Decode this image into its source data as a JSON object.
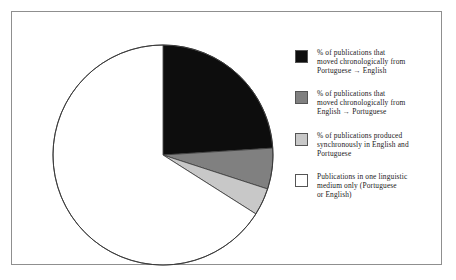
{
  "chart_data": {
    "type": "pie",
    "title": "",
    "subtitle": "",
    "xlabel": "",
    "ylabel": "",
    "grid": false,
    "legend_position": "right",
    "start_angle_deg": 0,
    "direction": "clockwise",
    "categories": [
      "% of publications that moved chronologically from Portuguese → English",
      "% of publications that moved chronologically from English → Portuguese",
      "% of publications produced synchronously in English and Portuguese",
      "Publications in one linguistic medium only (Portuguese or English)"
    ],
    "values": [
      24,
      6,
      4,
      66
    ],
    "colors": [
      "#0d0d0d",
      "#808080",
      "#c8c8c8",
      "#ffffff"
    ],
    "slice_edge_color": "#3a3a3a",
    "annotations": []
  },
  "figure": {
    "border_color": "#8f8f8f",
    "background": "#ffffff"
  },
  "pie": {
    "center_x": 121,
    "center_y": 123,
    "radius": 110,
    "outline_color": "#3a3a3a",
    "slices": [
      {
        "name": "portuguese-to-english",
        "percent": 24,
        "color": "#0d0d0d",
        "start_deg": 0,
        "end_deg": 86.4
      },
      {
        "name": "english-to-portuguese",
        "percent": 6,
        "color": "#808080",
        "start_deg": 86.4,
        "end_deg": 108.0
      },
      {
        "name": "synchronous-english-portuguese",
        "percent": 4,
        "color": "#c8c8c8",
        "start_deg": 108.0,
        "end_deg": 122.4
      },
      {
        "name": "single-linguistic-medium",
        "percent": 66,
        "color": "#ffffff",
        "start_deg": 122.4,
        "end_deg": 360.0
      }
    ]
  },
  "legend": {
    "items": [
      {
        "swatch_color": "#0d0d0d",
        "lines": [
          "% of publications that",
          "moved chronologically from",
          "Portuguese → English"
        ]
      },
      {
        "swatch_color": "#808080",
        "lines": [
          "% of publications that",
          "moved chronologically from",
          "English → Portuguese"
        ]
      },
      {
        "swatch_color": "#c8c8c8",
        "lines": [
          "% of publications produced",
          "synchronously in English and",
          "Portuguese"
        ]
      },
      {
        "swatch_color": "#ffffff",
        "lines": [
          "Publications in one linguistic",
          "medium only (Portuguese",
          "or English)"
        ]
      }
    ]
  }
}
